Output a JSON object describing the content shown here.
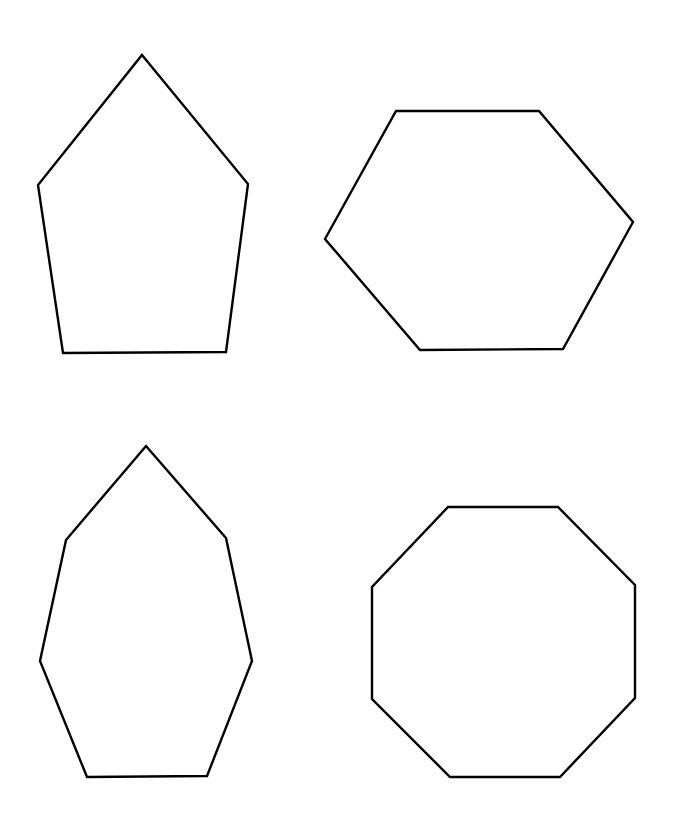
{
  "canvas": {
    "width": 675,
    "height": 815,
    "background": "#ffffff",
    "stroke_color": "#000000",
    "stroke_width": 2.4
  },
  "shapes": [
    {
      "name": "pentagon",
      "sides": 5,
      "position": "top-left",
      "points": [
        [
          142,
          55
        ],
        [
          248,
          184
        ],
        [
          226,
          352
        ],
        [
          63,
          353
        ],
        [
          38,
          185
        ]
      ]
    },
    {
      "name": "hexagon",
      "sides": 6,
      "position": "top-right",
      "points": [
        [
          396,
          111
        ],
        [
          539,
          111
        ],
        [
          633,
          222
        ],
        [
          563,
          349
        ],
        [
          420,
          350
        ],
        [
          325,
          239
        ]
      ]
    },
    {
      "name": "heptagon",
      "sides": 7,
      "position": "bottom-left",
      "points": [
        [
          146,
          446
        ],
        [
          226,
          538
        ],
        [
          252,
          661
        ],
        [
          207,
          776
        ],
        [
          87,
          777
        ],
        [
          40,
          661
        ],
        [
          66,
          540
        ]
      ]
    },
    {
      "name": "octagon",
      "sides": 8,
      "position": "bottom-right",
      "points": [
        [
          448,
          507
        ],
        [
          558,
          507
        ],
        [
          635,
          585
        ],
        [
          635,
          698
        ],
        [
          560,
          777
        ],
        [
          450,
          777
        ],
        [
          372,
          699
        ],
        [
          372,
          587
        ]
      ]
    }
  ]
}
